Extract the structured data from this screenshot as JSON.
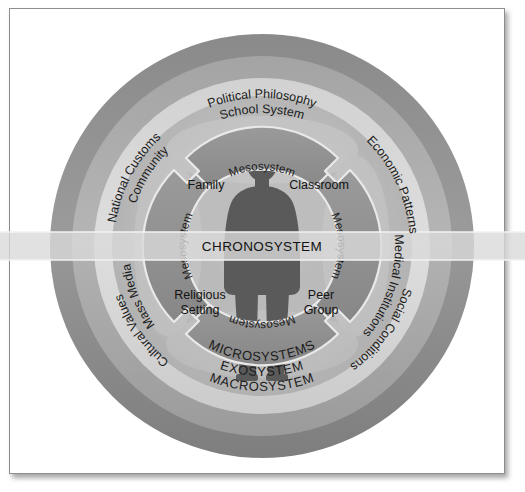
{
  "diagram": {
    "type": "concentric-rings"
  },
  "rings": {
    "macrosystem": {
      "name": "MACROSYSTEM",
      "label_bottom": "MACROSYSTEM",
      "color": "#8e8e8e",
      "labels": [
        "Political Philosophy",
        "Economic Patterns",
        "Social Conditions",
        "Cultural Values",
        "National Customs"
      ]
    },
    "exosystem": {
      "name": "EXOSYSTEM",
      "label_bottom": "EXOSYSTEM",
      "color": "#a8a8a8",
      "labels": [
        "School System",
        "Medical Institutions",
        "Mass Media",
        "Community"
      ]
    },
    "microsystems": {
      "name": "MICROSYSTEMS",
      "label_bottom": "MICROSYSTEMS",
      "color": "#cfcfcf",
      "labels": [
        "Family",
        "Classroom",
        "Religious Setting",
        "Peer Group"
      ]
    }
  },
  "mesosystem": {
    "label": "Mesosystem",
    "arrows": [
      "top",
      "right",
      "bottom",
      "left"
    ],
    "color": "#8f8f8f"
  },
  "chronosystem": {
    "label": "CHRONOSYSTEM",
    "band_color": "#d9d9d9"
  },
  "microsystem_labels": {
    "family": "Family",
    "classroom": "Classroom",
    "religious_setting_line1": "Religious",
    "religious_setting_line2": "Setting",
    "peer_group_line1": "Peer",
    "peer_group_line2": "Group"
  },
  "outer_labels": {
    "political_philosophy": "Political Philosophy",
    "economic_patterns": "Economic Patterns",
    "social_conditions": "Social Conditions",
    "cultural_values": "Cultural Values",
    "national_customs": "National Customs"
  },
  "exo_labels": {
    "school_system": "School System",
    "medical_institutions": "Medical Institutions",
    "mass_media": "Mass Media",
    "community": "Community"
  },
  "bottom_labels": {
    "microsystems": "MICROSYSTEMS",
    "exosystem": "EXOSYSTEM",
    "macrosystem": "MACROSYSTEM"
  },
  "meso_labels": {
    "top": "Mesosystem",
    "right": "Mesosystem",
    "bottom": "Mesosystem",
    "left": "Mesosystem"
  },
  "center_figure": {
    "name": "person-silhouette",
    "color": "#5a5a5a"
  },
  "colors": {
    "macro": "#8e8e8e",
    "exo": "#a8a8a8",
    "micro_outerband": "#d4d4d4",
    "micro": "#bdbdbd",
    "inner": "#b4b4b4",
    "arrow": "#909090",
    "arrow_stroke": "#e8e8e8",
    "figure": "#5a5a5a",
    "text": "#1b1b1b",
    "frame": "#8d8d8d",
    "background": "#ffffff"
  }
}
